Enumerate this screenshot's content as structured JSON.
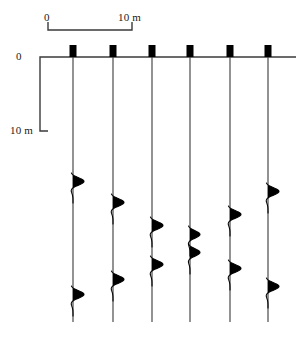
{
  "figure": {
    "background_color": "#ffffff",
    "line_color": "#3a3a3a",
    "fill_color": "#000000",
    "text_color": "#1a1a1a",
    "width": 308,
    "height": 339
  },
  "horizontal_scale": {
    "left_label": "0",
    "right_label": "10 m",
    "bar_x_start": 48,
    "bar_x_end": 132,
    "bar_y": 30,
    "tick_height": 8,
    "units": "m",
    "span_value": 10
  },
  "vertical_scale": {
    "top_label": "0",
    "bottom_label": "10 m",
    "bar_x": 40,
    "bar_y_start": 57,
    "bar_y_end": 131,
    "tick_width": 8,
    "units": "m",
    "span_value": 10
  },
  "datum_line": {
    "y": 57,
    "x_start": 48,
    "x_end": 296
  },
  "wellhead_markers": {
    "width": 7,
    "height": 12,
    "color": "#000000",
    "y_top": 45
  },
  "traces": [
    {
      "id": "trace-1",
      "x": 73,
      "top": 50,
      "bottom": 322,
      "events": [
        {
          "y": 185,
          "amplitude": 11,
          "label": "event-a"
        },
        {
          "y": 298,
          "amplitude": 11,
          "label": "event-b"
        }
      ]
    },
    {
      "id": "trace-2",
      "x": 113,
      "top": 50,
      "bottom": 322,
      "events": [
        {
          "y": 206,
          "amplitude": 11,
          "label": "event-a"
        },
        {
          "y": 283,
          "amplitude": 11,
          "label": "event-b"
        }
      ]
    },
    {
      "id": "trace-3",
      "x": 152,
      "top": 50,
      "bottom": 322,
      "events": [
        {
          "y": 229,
          "amplitude": 11,
          "label": "event-a"
        },
        {
          "y": 268,
          "amplitude": 11,
          "label": "event-b"
        }
      ]
    },
    {
      "id": "trace-4",
      "x": 190,
      "top": 50,
      "bottom": 322,
      "events": [
        {
          "y": 238,
          "amplitude": 10,
          "label": "event-a"
        },
        {
          "y": 256,
          "amplitude": 10,
          "label": "event-b"
        }
      ]
    },
    {
      "id": "trace-5",
      "x": 230,
      "top": 50,
      "bottom": 322,
      "events": [
        {
          "y": 218,
          "amplitude": 11,
          "label": "event-a"
        },
        {
          "y": 272,
          "amplitude": 11,
          "label": "event-b"
        }
      ]
    },
    {
      "id": "trace-6",
      "x": 268,
      "top": 50,
      "bottom": 322,
      "events": [
        {
          "y": 195,
          "amplitude": 11,
          "label": "event-a"
        },
        {
          "y": 290,
          "amplitude": 11,
          "label": "event-b"
        }
      ]
    }
  ]
}
